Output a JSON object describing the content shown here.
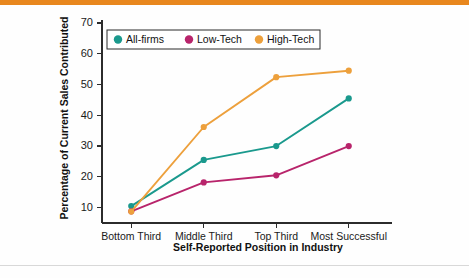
{
  "page": {
    "accent_color": "#e8871e",
    "background_color": "#fefefe",
    "rule_color": "#d8d8d8"
  },
  "chart_data": {
    "type": "line",
    "title": "",
    "subtitle": "",
    "xlabel": "Self-Reported Position in Industry",
    "ylabel": "Percentage of Current Sales Contributed",
    "categories": [
      "Bottom Third",
      "Middle Third",
      "Top Third",
      "Most Successful"
    ],
    "series": [
      {
        "name": "All-firms",
        "color": "#1a998d",
        "values": [
          10.5,
          25.5,
          30.0,
          45.5
        ]
      },
      {
        "name": "Low-Tech",
        "color": "#b8246b",
        "values": [
          8.8,
          18.2,
          20.5,
          30.0
        ]
      },
      {
        "name": "High-Tech",
        "color": "#eda03c",
        "values": [
          8.7,
          36.2,
          52.4,
          54.5
        ]
      }
    ],
    "ylim": [
      5,
      70
    ],
    "yticks": [
      10,
      20,
      30,
      40,
      50,
      60,
      70
    ],
    "ytick_labels": [
      "10",
      "20",
      "30",
      "40",
      "50",
      "60",
      "70"
    ],
    "grid": false,
    "legend_position": "top-left",
    "legend_entries": [
      "All-firms",
      "Low-Tech",
      "High-Tech"
    ]
  }
}
